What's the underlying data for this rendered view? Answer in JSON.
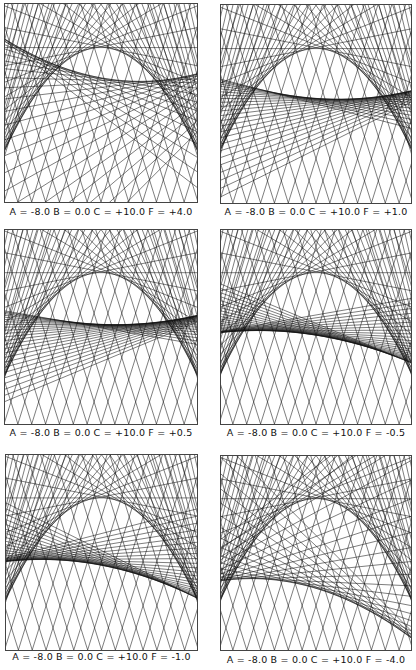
{
  "figure": {
    "layout": {
      "rows": 3,
      "cols": 2
    },
    "line_color": "#111111",
    "panels": [
      {
        "id": "p1",
        "caption": "A = -8.0  B = 0.0  C = +10.0  F = +4.0",
        "params": {
          "A": -8.0,
          "B": 0.0,
          "C": 10.0,
          "F": 4.0
        },
        "box": {
          "x": 4,
          "y": 3,
          "w": 194,
          "h": 200
        },
        "caption_y": 212
      },
      {
        "id": "p2",
        "caption": "A = -8.0  B = 0.0  C = +10.0  F = +1.0",
        "params": {
          "A": -8.0,
          "B": 0.0,
          "C": 10.0,
          "F": 1.0
        },
        "box": {
          "x": 220,
          "y": 4,
          "w": 192,
          "h": 200
        },
        "caption_y": 212
      },
      {
        "id": "p3",
        "caption": "A = -8.0  B = 0.0  C = +10.0  F = +0.5",
        "params": {
          "A": -8.0,
          "B": 0.0,
          "C": 10.0,
          "F": 0.5
        },
        "box": {
          "x": 4,
          "y": 229,
          "w": 194,
          "h": 196
        },
        "caption_y": 433
      },
      {
        "id": "p4",
        "caption": "A = -8.0  B = 0.0  C = +10.0  F = -0.5",
        "params": {
          "A": -8.0,
          "B": 0.0,
          "C": 10.0,
          "F": -0.5
        },
        "box": {
          "x": 220,
          "y": 229,
          "w": 192,
          "h": 196
        },
        "caption_y": 433
      },
      {
        "id": "p5",
        "caption": "A = -8.0  B = 0.0  C = +10.0  F = -1.0",
        "params": {
          "A": -8.0,
          "B": 0.0,
          "C": 10.0,
          "F": -1.0
        },
        "box": {
          "x": 5,
          "y": 454,
          "w": 193,
          "h": 197
        },
        "caption_y": 657
      },
      {
        "id": "p6",
        "caption": "A = -8.0  B = 0.0  C = +10.0  F = -4.0",
        "params": {
          "A": -8.0,
          "B": 0.0,
          "C": 10.0,
          "F": -4.0
        },
        "box": {
          "x": 220,
          "y": 455,
          "w": 192,
          "h": 196
        },
        "caption_y": 660
      }
    ]
  }
}
